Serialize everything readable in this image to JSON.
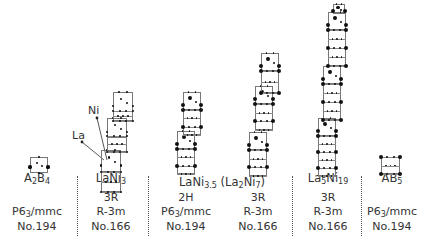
{
  "structures": [
    {
      "name_html": "A<sub>2</sub>B<sub>4</sub>",
      "name": "A2B4",
      "symmetry": "",
      "space_group": "P6<sub>3</sub>/mmc",
      "space_group_text": "P63/mmc",
      "number": "No.194",
      "cx": 37
    },
    {
      "name_html": "LaNi<sub>3</sub>",
      "name": "LaNi3",
      "symmetry": "3R",
      "space_group": "R-3m",
      "space_group_text": "R-3m",
      "number": "No.166",
      "cx": 111
    },
    {
      "name_html": "",
      "name": "",
      "symmetry": "2H",
      "space_group": "P6<sub>3</sub>/mmc",
      "space_group_text": "P63/mmc",
      "number": "No.194",
      "cx": 186
    },
    {
      "name_html": "",
      "name": "",
      "symmetry": "3R",
      "space_group": "R-3m",
      "space_group_text": "R-3m",
      "number": "No.166",
      "cx": 258
    },
    {
      "name_html": "La<sub>5</sub>Ni<sub>19</sub>",
      "name": "La5Ni19",
      "symmetry": "3R",
      "space_group": "R-3m",
      "space_group_text": "R-3m",
      "number": "No.166",
      "cx": 328
    },
    {
      "name_html": "AB<sub>5</sub>",
      "name": "AB5",
      "symmetry": "",
      "space_group": "P6<sub>3</sub>/mmc",
      "space_group_text": "P63/mmc",
      "number": "No.194",
      "cx": 392
    }
  ],
  "shared_label": {
    "html": "LaNi<sub>3.5</sub> (La<sub>2</sub>Ni<sub>7</sub>)",
    "text": "LaNi3.5 (La2Ni7)",
    "cx": 222
  },
  "annotations": {
    "ni": "Ni",
    "la": "La"
  },
  "separators_x": [
    77,
    148,
    292,
    361
  ],
  "stacks": [
    {
      "blocks": [
        [
          30,
          157,
          18,
          16,
          "a2b4"
        ]
      ]
    },
    {
      "blocks": [
        [
          101,
          150,
          20,
          22,
          "ab2"
        ],
        [
          101,
          172,
          20,
          20,
          "ab5"
        ],
        [
          107,
          118,
          20,
          20,
          "ab2"
        ],
        [
          107,
          136,
          20,
          16,
          "ab5"
        ],
        [
          113,
          92,
          20,
          20,
          "ab2"
        ],
        [
          113,
          111,
          20,
          10,
          "ab5"
        ]
      ]
    },
    {
      "blocks": [
        [
          177,
          131,
          18,
          18,
          "ab2"
        ],
        [
          177,
          149,
          18,
          25,
          "ab5s"
        ],
        [
          183,
          92,
          18,
          18,
          "ab2"
        ],
        [
          183,
          110,
          18,
          25,
          "ab5s"
        ]
      ]
    },
    {
      "blocks": [
        [
          249,
          132,
          18,
          18,
          "ab2"
        ],
        [
          249,
          150,
          18,
          26,
          "ab5s"
        ],
        [
          255,
          86,
          18,
          18,
          "ab2"
        ],
        [
          255,
          104,
          18,
          26,
          "ab5s"
        ],
        [
          261,
          53,
          18,
          18,
          "ab2"
        ],
        [
          261,
          71,
          18,
          22,
          "ab5s"
        ]
      ]
    },
    {
      "blocks": [
        [
          318,
          118,
          18,
          18,
          "ab2"
        ],
        [
          318,
          136,
          18,
          40,
          "ab5l"
        ],
        [
          323,
          66,
          18,
          18,
          "ab2"
        ],
        [
          323,
          84,
          18,
          36,
          "ab5l"
        ],
        [
          328,
          12,
          18,
          18,
          "ab2"
        ],
        [
          328,
          30,
          18,
          36,
          "ab5l"
        ],
        [
          333,
          4,
          12,
          10,
          "top"
        ]
      ]
    },
    {
      "blocks": [
        [
          381,
          157,
          19,
          17,
          "ab5"
        ]
      ]
    }
  ]
}
